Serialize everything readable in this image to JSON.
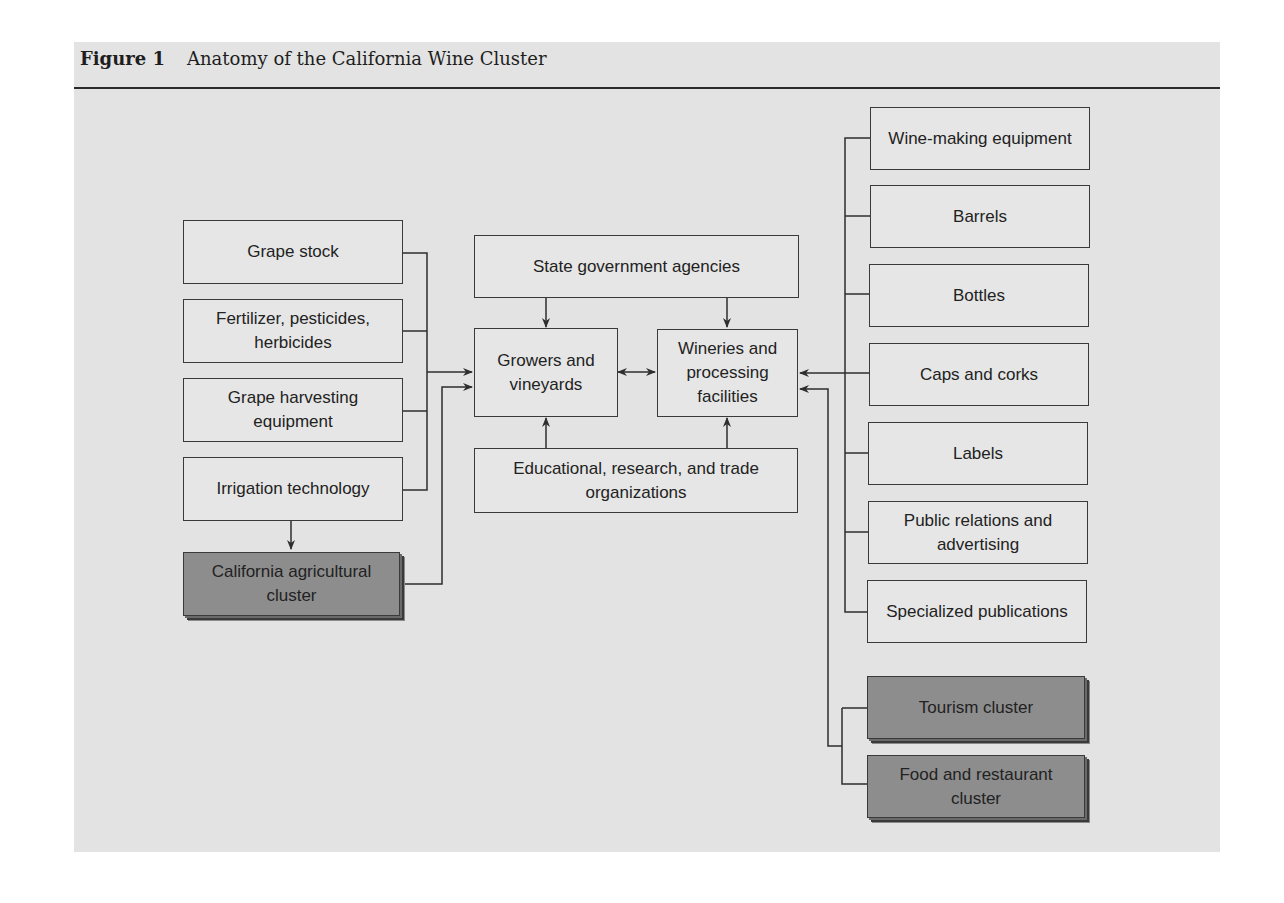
{
  "figure": {
    "label": "Figure 1",
    "title": "Anatomy of the California Wine Cluster"
  },
  "left_inputs": [
    {
      "id": "grape-stock",
      "label": "Grape stock"
    },
    {
      "id": "fertilizer",
      "label": "Fertilizer, pesticides, herbicides"
    },
    {
      "id": "harvesting",
      "label": "Grape harvesting equipment"
    },
    {
      "id": "irrigation",
      "label": "Irrigation technology"
    }
  ],
  "left_cluster": {
    "id": "ag-cluster",
    "label": "California agricultural cluster"
  },
  "center": {
    "state": "State government agencies",
    "growers": "Growers and vineyards",
    "wineries": "Wineries and processing facilities",
    "education": "Educational, research, and trade organizations"
  },
  "right_inputs": [
    {
      "id": "wine-making-equipment",
      "label": "Wine-making equipment"
    },
    {
      "id": "barrels",
      "label": "Barrels"
    },
    {
      "id": "bottles",
      "label": "Bottles"
    },
    {
      "id": "caps-corks",
      "label": "Caps and corks"
    },
    {
      "id": "labels",
      "label": "Labels"
    },
    {
      "id": "pr-advertising",
      "label": "Public relations and advertising"
    },
    {
      "id": "specialized-publications",
      "label": "Specialized publications"
    }
  ],
  "right_clusters": [
    {
      "id": "tourism-cluster",
      "label": "Tourism cluster"
    },
    {
      "id": "food-restaurant-cluster",
      "label": "Food and restaurant cluster"
    }
  ],
  "colors": {
    "panel": "#e3e3e3",
    "box": "#e6e6e6",
    "cluster_box": "#8d8d8d",
    "line": "#2e2e2e"
  }
}
